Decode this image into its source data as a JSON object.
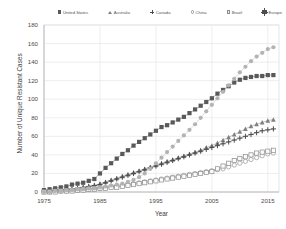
{
  "chart_data": {
    "type": "line",
    "title": "",
    "xlabel": "Year",
    "ylabel": "Number of Unique Resistant Cases",
    "xlim": [
      1975,
      2017
    ],
    "ylim": [
      0,
      180
    ],
    "ytick_labels": [
      "0",
      "20",
      "40",
      "60",
      "80",
      "100",
      "120",
      "140",
      "160",
      "180"
    ],
    "ytick_values": [
      0,
      20,
      40,
      60,
      80,
      100,
      120,
      140,
      160,
      180
    ],
    "xtick_labels": [
      "1975",
      "1985",
      "1995",
      "2005",
      "2015"
    ],
    "xtick_values": [
      1975,
      1985,
      1995,
      2005,
      2015
    ],
    "grid": true,
    "legend_position": "top",
    "x": [
      1975,
      1976,
      1977,
      1978,
      1979,
      1980,
      1981,
      1982,
      1983,
      1984,
      1985,
      1986,
      1987,
      1988,
      1989,
      1990,
      1991,
      1992,
      1993,
      1994,
      1995,
      1996,
      1997,
      1998,
      1999,
      2000,
      2001,
      2002,
      2003,
      2004,
      2005,
      2006,
      2007,
      2008,
      2009,
      2010,
      2011,
      2012,
      2013,
      2014,
      2015,
      2016
    ],
    "series": [
      {
        "name": "United States",
        "marker": "square-filled",
        "color": "#595959",
        "values": [
          2,
          3,
          4,
          5,
          6,
          8,
          9,
          10,
          12,
          14,
          20,
          26,
          31,
          36,
          41,
          45,
          50,
          54,
          58,
          62,
          66,
          70,
          72,
          75,
          78,
          81,
          85,
          89,
          93,
          97,
          101,
          106,
          110,
          114,
          118,
          121,
          123,
          124,
          125,
          125,
          126,
          126
        ]
      },
      {
        "name": "Australia",
        "marker": "triangle",
        "color": "#808080",
        "values": [
          1,
          1,
          2,
          2,
          3,
          3,
          4,
          5,
          6,
          7,
          9,
          11,
          13,
          15,
          17,
          19,
          21,
          23,
          25,
          27,
          29,
          31,
          33,
          35,
          37,
          39,
          41,
          43,
          45,
          48,
          50,
          53,
          56,
          59,
          62,
          65,
          68,
          71,
          73,
          75,
          77,
          78
        ]
      },
      {
        "name": "Canada",
        "marker": "plus",
        "color": "#4d4d4d",
        "values": [
          1,
          1,
          2,
          2,
          3,
          3,
          4,
          5,
          6,
          7,
          8,
          10,
          12,
          14,
          16,
          18,
          20,
          22,
          24,
          26,
          28,
          30,
          32,
          34,
          36,
          38,
          40,
          42,
          44,
          46,
          48,
          50,
          52,
          54,
          56,
          58,
          60,
          62,
          64,
          66,
          67,
          68
        ]
      },
      {
        "name": "China",
        "marker": "circle-open",
        "color": "#999999",
        "values": [
          0,
          0,
          1,
          1,
          1,
          2,
          2,
          3,
          3,
          4,
          4,
          5,
          6,
          6,
          7,
          8,
          9,
          10,
          11,
          12,
          13,
          14,
          15,
          16,
          17,
          18,
          19,
          20,
          21,
          22,
          23,
          24,
          25,
          27,
          29,
          31,
          33,
          35,
          37,
          39,
          41,
          42
        ]
      },
      {
        "name": "Brazil",
        "marker": "square-open",
        "color": "#8c8c8c",
        "values": [
          0,
          0,
          0,
          1,
          1,
          1,
          2,
          2,
          3,
          3,
          4,
          4,
          5,
          5,
          6,
          7,
          8,
          9,
          10,
          11,
          12,
          13,
          14,
          15,
          16,
          17,
          18,
          19,
          20,
          21,
          22,
          25,
          28,
          31,
          34,
          36,
          38,
          40,
          42,
          43,
          44,
          45
        ]
      },
      {
        "name": "Europe",
        "marker": "circle-filled",
        "color": "#b3b3b3",
        "values": [
          0,
          0,
          1,
          1,
          2,
          2,
          3,
          3,
          4,
          4,
          5,
          6,
          7,
          8,
          9,
          11,
          13,
          16,
          20,
          25,
          31,
          37,
          43,
          49,
          55,
          61,
          67,
          73,
          80,
          87,
          94,
          101,
          108,
          115,
          122,
          129,
          135,
          141,
          146,
          150,
          154,
          156
        ]
      }
    ]
  }
}
